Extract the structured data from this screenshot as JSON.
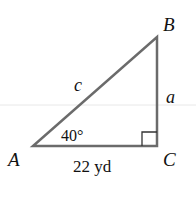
{
  "diagram": {
    "type": "right-triangle",
    "vertices": {
      "A": {
        "label": "A"
      },
      "B": {
        "label": "B"
      },
      "C": {
        "label": "C"
      }
    },
    "sides": {
      "hypotenuse": {
        "label": "c"
      },
      "opposite": {
        "label": "a"
      },
      "adjacent": {
        "label": "22 yd"
      }
    },
    "angle_A": {
      "label": "40°"
    },
    "right_angle_at": "C",
    "colors": {
      "stroke": "#6b6b6b",
      "text": "#111111",
      "background": "#ffffff",
      "guide_line": "#e6e6e6"
    }
  }
}
